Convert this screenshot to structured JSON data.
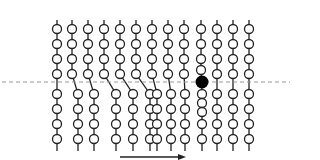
{
  "diagram": {
    "colors": {
      "background": "#ffffff",
      "stroke": "#222222",
      "bead_fill": "#ffffff",
      "particle_fill": "#000000",
      "dashed_line": "#999999",
      "arrow": "#222222"
    },
    "dashed_line": {
      "y": 82,
      "x1": 2,
      "x2": 290
    },
    "particle": {
      "x": 202,
      "y": 82,
      "r": 6.5
    },
    "bead_radius": 4.5,
    "chain_top": 20,
    "chain_bottom": 151,
    "columns": [
      {
        "top_x": 57,
        "bottom_x": 57,
        "top_beads": [
          29,
          44,
          59,
          74
        ],
        "bottom_beads": [
          94,
          109,
          124,
          139
        ]
      },
      {
        "top_x": 72,
        "bottom_x": 78,
        "top_beads": [
          29,
          44,
          59,
          74
        ],
        "bottom_beads": [
          94,
          109,
          124,
          139
        ]
      },
      {
        "top_x": 88,
        "bottom_x": 94,
        "top_beads": [
          29,
          44,
          59,
          74
        ],
        "bottom_beads": [
          94,
          109,
          124,
          139
        ]
      },
      {
        "top_x": 104,
        "bottom_x": 116,
        "top_beads": [
          29,
          44,
          59,
          74
        ],
        "bottom_beads": [
          94,
          109,
          124,
          139
        ]
      },
      {
        "top_x": 120,
        "bottom_x": 133,
        "top_beads": [
          29,
          44,
          59,
          74
        ],
        "bottom_beads": [
          94,
          109,
          124,
          139
        ]
      },
      {
        "top_x": 136,
        "bottom_x": 150,
        "top_beads": [
          29,
          44,
          59,
          74
        ],
        "bottom_beads": [
          94,
          109,
          124,
          139
        ]
      },
      {
        "top_x": 152,
        "bottom_x": 157,
        "top_beads": [
          29,
          44,
          59,
          74
        ],
        "bottom_beads": [
          94,
          109,
          124,
          139
        ]
      },
      {
        "top_x": 168,
        "bottom_x": 171,
        "top_beads": [
          29,
          44,
          59,
          74
        ],
        "bottom_beads": [
          94,
          109,
          124,
          139
        ]
      },
      {
        "top_x": 184,
        "bottom_x": 185,
        "top_beads": [
          29,
          44,
          59,
          74
        ],
        "bottom_beads": [
          94,
          109,
          124,
          139
        ]
      },
      {
        "top_x": 201,
        "bottom_x": 202,
        "top_beads": [
          29,
          44,
          59,
          70
        ],
        "bottom_beads": [
          94,
          103,
          112,
          124,
          139
        ],
        "pinned": true
      },
      {
        "top_x": 217,
        "bottom_x": 217,
        "top_beads": [
          29,
          44,
          59,
          74
        ],
        "bottom_beads": [
          94,
          109,
          124,
          139
        ]
      },
      {
        "top_x": 233,
        "bottom_x": 233,
        "top_beads": [
          29,
          44,
          59,
          74
        ],
        "bottom_beads": [
          94,
          109,
          124,
          139
        ]
      },
      {
        "top_x": 249,
        "bottom_x": 249,
        "top_beads": [
          29,
          44,
          59,
          74
        ],
        "bottom_beads": [
          94,
          109,
          124,
          139
        ]
      }
    ],
    "arrow": {
      "x1": 120,
      "x2": 186,
      "y": 157
    }
  }
}
